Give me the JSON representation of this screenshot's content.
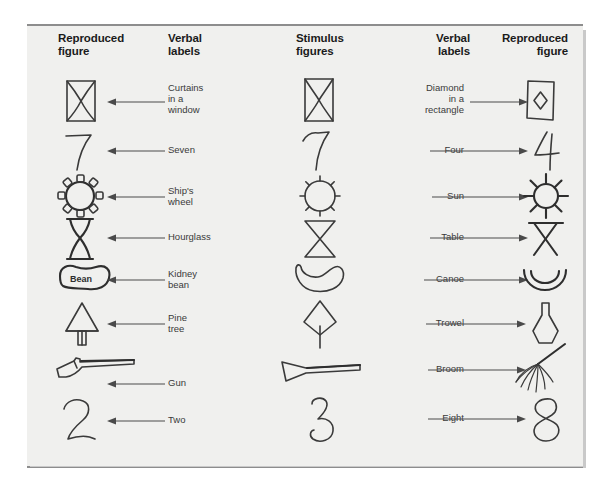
{
  "figure": {
    "background_color": "#f0f0ee",
    "rule_color": "#8d8d8d",
    "ink_color": "#3a3a3a"
  },
  "headers": [
    {
      "id": "reproduced-figure-left",
      "label": "Reproduced\nfigure"
    },
    {
      "id": "verbal-labels-left",
      "label": "Verbal\nlabels"
    },
    {
      "id": "stimulus-figures",
      "label": "Stimulus\nfigures"
    },
    {
      "id": "verbal-labels-right",
      "label": "Verbal\nlabels"
    },
    {
      "id": "reproduced-figure-right",
      "label": "Reproduced\nfigure"
    }
  ],
  "rows": [
    {
      "index": 1,
      "left_label": "Curtains\nin a\nwindow",
      "stimulus": "curtains-window-diamond-rectangle",
      "right_label": "Diamond\nin a\nrectangle",
      "left_figure": "curtains-in-a-window",
      "right_figure": "diamond-in-a-rectangle"
    },
    {
      "index": 2,
      "left_label": "Seven",
      "stimulus": "seven-four",
      "right_label": "Four",
      "left_figure": "seven",
      "right_figure": "four"
    },
    {
      "index": 3,
      "left_label": "Ship's\nwheel",
      "stimulus": "circle-with-spokes",
      "right_label": "Sun",
      "left_figure": "ships-wheel",
      "right_figure": "sun"
    },
    {
      "index": 4,
      "left_label": "Hourglass",
      "stimulus": "two-triangles",
      "right_label": "Table",
      "left_figure": "hourglass",
      "right_figure": "table"
    },
    {
      "index": 5,
      "left_label": "Kidney\nbean",
      "stimulus": "crescent-shape",
      "right_label": "Canoe",
      "left_figure": "kidney-bean",
      "right_figure": "canoe"
    },
    {
      "index": 6,
      "left_label": "Pine\ntree",
      "stimulus": "diamond-with-stem",
      "right_label": "Trowel",
      "left_figure": "pine-tree",
      "right_figure": "trowel"
    },
    {
      "index": 7,
      "left_label": "Gun",
      "stimulus": "tapered-bar",
      "right_label": "Broom",
      "left_figure": "gun",
      "right_figure": "broom"
    },
    {
      "index": 8,
      "left_label": "Two",
      "stimulus": "two-eight",
      "right_label": "Eight",
      "left_figure": "two",
      "right_figure": "eight"
    }
  ],
  "annotations": {
    "kidney_bean_inner_text": "Bean"
  }
}
